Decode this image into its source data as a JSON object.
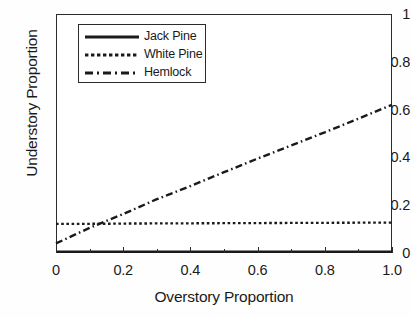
{
  "chart_data": {
    "type": "line",
    "title": "",
    "xlabel": "Overstory Proportion",
    "ylabel": "Understory Proportion",
    "xlim": [
      0,
      1.0
    ],
    "ylim": [
      0,
      1
    ],
    "grid": false,
    "legend_position": "upper left (inside axes)",
    "xticks": [
      "0",
      "0.2",
      "0.4",
      "0.6",
      "0.8",
      "1.0"
    ],
    "xtick_values": [
      0,
      0.2,
      0.4,
      0.6,
      0.8,
      1.0
    ],
    "xminor_tick_values": [
      0.1,
      0.3,
      0.5,
      0.7,
      0.9
    ],
    "yticks": [
      "0",
      "0.2",
      "0.4",
      "0.6",
      "0.8",
      "1"
    ],
    "ytick_values": [
      0,
      0.2,
      0.4,
      0.6,
      0.8,
      1.0
    ],
    "x": [
      0.0,
      0.1,
      0.2,
      0.3,
      0.4,
      0.5,
      0.6,
      0.7,
      0.8,
      0.9,
      1.0
    ],
    "series": [
      {
        "name": "Jack Pine",
        "style": "solid",
        "color": "#1a1a1a",
        "values": [
          0.005,
          0.005,
          0.005,
          0.005,
          0.005,
          0.005,
          0.005,
          0.005,
          0.005,
          0.005,
          0.005
        ]
      },
      {
        "name": "White Pine",
        "style": "dotted",
        "color": "#1a1a1a",
        "values": [
          0.122,
          0.122,
          0.123,
          0.124,
          0.124,
          0.125,
          0.125,
          0.126,
          0.126,
          0.127,
          0.127
        ]
      },
      {
        "name": "Hemlock",
        "style": "dashdot",
        "color": "#1a1a1a",
        "values": [
          0.04,
          0.105,
          0.163,
          0.225,
          0.28,
          0.338,
          0.395,
          0.45,
          0.505,
          0.562,
          0.62
        ]
      }
    ]
  },
  "axes": {
    "ylabel": "Understory Proportion",
    "xlabel": "Overstory Proportion",
    "ytick_labels": [
      "1",
      "0.8",
      "0.6",
      "0.4",
      "0.2",
      "0"
    ],
    "xtick_labels": [
      "0",
      "0.2",
      "0.4",
      "0.6",
      "0.8",
      "1.0"
    ]
  },
  "legend": {
    "entries": [
      {
        "label": "Jack Pine",
        "style": "solid"
      },
      {
        "label": "White Pine",
        "style": "dotted"
      },
      {
        "label": "Hemlock",
        "style": "dashdot"
      }
    ]
  },
  "colors": {
    "line": "#1a1a1a",
    "axis": "#2b2b2b",
    "background": "#ffffff"
  }
}
